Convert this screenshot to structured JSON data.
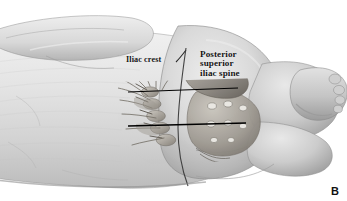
{
  "figure": {
    "panel_letter": "B",
    "type": "grayscale-medical-illustration"
  },
  "labels": {
    "iliac_crest": "Iliac crest",
    "psis_line1": "Posterior",
    "psis_line2": "superior",
    "psis_line3": "iliac spine"
  },
  "colors": {
    "background": "#ffffff",
    "skin_light": "#e6e6e6",
    "skin_mid": "#cfcfcf",
    "skin_shadow": "#a8a8a8",
    "skin_deep_shadow": "#8d8d8d",
    "bone_light": "#c8c4bd",
    "bone_mid": "#a5a098",
    "bone_dark": "#6e6a63",
    "outline": "#4a4a4a",
    "reference_line": "#000000",
    "label_text": "#141414"
  },
  "annotations": {
    "reference_line_upper": "horizontal landmark line at iliac crest level",
    "reference_line_lower": "horizontal landmark line at posterior superior iliac spine level",
    "midline": "vertical spinal midline curve"
  }
}
